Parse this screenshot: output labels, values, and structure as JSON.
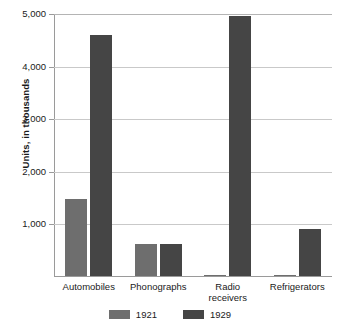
{
  "chart_data": {
    "type": "bar",
    "title": "",
    "xlabel": "",
    "ylabel": "Units, in thousands",
    "categories": [
      "Automobiles",
      "Phonographs",
      "Radio receivers",
      "Refrigerators"
    ],
    "series": [
      {
        "name": "1921",
        "color": "#6e6e6e",
        "values": [
          1470,
          600,
          5,
          5
        ]
      },
      {
        "name": "1929",
        "color": "#454545",
        "values": [
          4580,
          600,
          4940,
          900
        ]
      }
    ],
    "ylim": [
      0,
      5000
    ],
    "yticks": [
      0,
      1000,
      2000,
      3000,
      4000,
      5000
    ],
    "ytick_labels": [
      "",
      "1,000",
      "2,000",
      "3,000",
      "4,000",
      "5,000"
    ],
    "grid": true,
    "legend_position": "bottom-center",
    "axis_color": "#9a9a9a",
    "gridline_color": "#c9c9c9",
    "background": "#ffffff"
  },
  "axis": {
    "y_title": "Units, in thousands",
    "ticks": [
      {
        "value": 5000,
        "label": "5,000"
      },
      {
        "value": 4000,
        "label": "4,000"
      },
      {
        "value": 3000,
        "label": "3,000"
      },
      {
        "value": 2000,
        "label": "2,000"
      },
      {
        "value": 1000,
        "label": "1,000"
      }
    ]
  },
  "categories": [
    {
      "label_line1": "Automobiles",
      "label_line2": ""
    },
    {
      "label_line1": "Phonographs",
      "label_line2": ""
    },
    {
      "label_line1": "Radio",
      "label_line2": "receivers"
    },
    {
      "label_line1": "Refrigerators",
      "label_line2": ""
    }
  ],
  "legend": [
    {
      "label": "1921",
      "color": "#6e6e6e"
    },
    {
      "label": "1929",
      "color": "#454545"
    }
  ]
}
